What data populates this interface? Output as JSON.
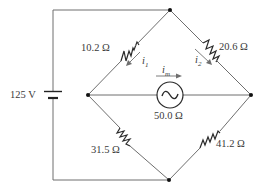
{
  "diagram": {
    "type": "Wheatstone bridge circuit",
    "battery": {
      "label": "125 V"
    },
    "resistors": [
      {
        "id": "R1",
        "label": "10.2 Ω",
        "position": "upper-left"
      },
      {
        "id": "R2",
        "label": "20.6 Ω",
        "position": "upper-right"
      },
      {
        "id": "R3",
        "label": "31.5 Ω",
        "position": "lower-left"
      },
      {
        "id": "R4",
        "label": "41.2 Ω",
        "position": "lower-right"
      }
    ],
    "meter": {
      "label": "50.0 Ω",
      "symbol": "~"
    },
    "currents": [
      {
        "id": "i1",
        "base": "i",
        "sub": "1"
      },
      {
        "id": "i2",
        "base": "i",
        "sub": "2"
      },
      {
        "id": "im",
        "base": "i",
        "sub": "m"
      }
    ]
  }
}
